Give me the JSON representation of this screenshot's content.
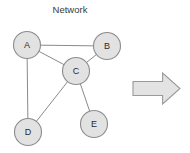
{
  "figure": {
    "title": "Network",
    "title_x": 70,
    "title_y": 13,
    "background_color": "#ffffff",
    "node_fill": "#e2e2e2",
    "node_stroke": "#8d8d8d",
    "edge_color": "#8a8a8a",
    "arrow_fill": "#e3e3e3",
    "arrow_stroke": "#9a9a9a",
    "node_radius": 13.5
  },
  "chart_data": {
    "type": "diagram",
    "title": "Network",
    "diagram_kind": "node-link-graph",
    "nodes": [
      {
        "id": "A",
        "label": "A",
        "x": 27,
        "y": 45
      },
      {
        "id": "B",
        "label": "B",
        "x": 107,
        "y": 46
      },
      {
        "id": "C",
        "label": "C",
        "x": 76,
        "y": 71
      },
      {
        "id": "D",
        "label": "D",
        "x": 28,
        "y": 132
      },
      {
        "id": "E",
        "label": "E",
        "x": 94,
        "y": 124
      }
    ],
    "edges": [
      {
        "source": "A",
        "target": "B"
      },
      {
        "source": "A",
        "target": "C"
      },
      {
        "source": "A",
        "target": "D"
      },
      {
        "source": "B",
        "target": "C"
      },
      {
        "source": "C",
        "target": "D"
      },
      {
        "source": "C",
        "target": "E"
      }
    ],
    "annotations": [
      {
        "kind": "block-arrow",
        "direction": "right",
        "x": 133,
        "y": 73,
        "width": 47,
        "height": 31
      }
    ]
  }
}
